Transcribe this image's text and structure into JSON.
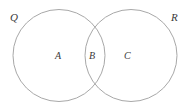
{
  "figure": {
    "type": "venn-diagram",
    "title": "",
    "background_color": "#ffffff",
    "stroke_color": "#a8a8a8",
    "text_color": "#3a3a3a",
    "width": 191,
    "height": 111
  },
  "sets": [
    {
      "id": "q",
      "label": "Q",
      "cx": 59,
      "cy": 55.5,
      "r": 46
    },
    {
      "id": "r",
      "label": "R",
      "cx": 131,
      "cy": 55.5,
      "r": 46
    }
  ],
  "regions": [
    {
      "id": "a",
      "label": "A",
      "description": "Q only"
    },
    {
      "id": "b",
      "label": "B",
      "description": "Q and R intersection"
    },
    {
      "id": "c",
      "label": "C",
      "description": "R only"
    }
  ]
}
